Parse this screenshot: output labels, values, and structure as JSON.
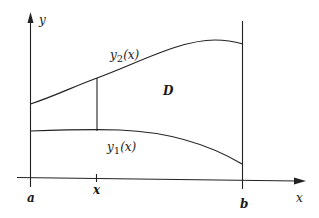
{
  "diagram": {
    "axes": {
      "x_label": "x",
      "y_label": "y"
    },
    "bounds": {
      "a_label": "a",
      "b_label": "b",
      "x_tick_label": "x"
    },
    "curves": {
      "upper_label_main": "y",
      "upper_label_sub": "2",
      "upper_label_arg": "(x)",
      "lower_label_main": "y",
      "lower_label_sub": "1",
      "lower_label_arg": "(x)"
    },
    "region_label": "D",
    "colors": {
      "ink": "#222222",
      "background": "#ffffff"
    }
  }
}
